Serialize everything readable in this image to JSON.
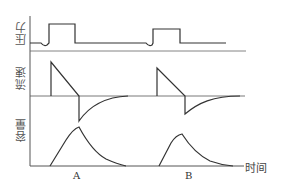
{
  "diagram": {
    "type": "ventilator waveform comparison",
    "panels": [
      {
        "id": "pressure",
        "label": "压力"
      },
      {
        "id": "flow",
        "label": "流速"
      },
      {
        "id": "volume",
        "label": "容量"
      }
    ],
    "x_axis_label": "时间",
    "cases": [
      {
        "id": "A",
        "label": "A"
      },
      {
        "id": "B",
        "label": "B"
      }
    ],
    "colors": {
      "line": "#333333",
      "axis": "#555555",
      "background": "#ffffff"
    }
  }
}
